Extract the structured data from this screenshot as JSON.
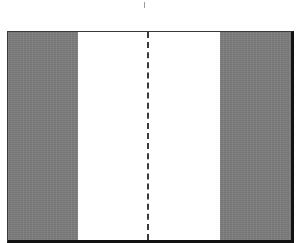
{
  "diagram": {
    "type": "cross-section",
    "colors": {
      "band": "#7d7d7d",
      "center": "#ffffff",
      "border": "#111111",
      "dashed_line": "#3a3a3a"
    },
    "regions": [
      {
        "name": "left-band",
        "fill": "gray"
      },
      {
        "name": "center-strip",
        "fill": "white"
      },
      {
        "name": "right-band",
        "fill": "gray"
      }
    ],
    "center_line": {
      "style": "dashed",
      "orientation": "vertical"
    }
  }
}
